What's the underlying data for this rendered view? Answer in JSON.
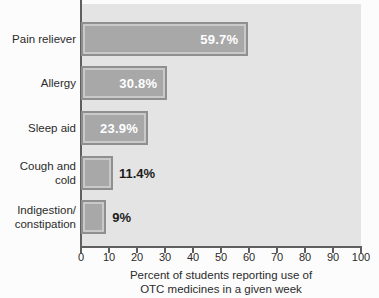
{
  "chart_data": {
    "type": "bar",
    "orientation": "horizontal",
    "categories": [
      "Pain reliever",
      "Allergy",
      "Sleep aid",
      "Cough and\ncold",
      "Indigestion/\nconstipation"
    ],
    "values": [
      59.7,
      30.8,
      23.9,
      11.4,
      9
    ],
    "value_labels": [
      "59.7%",
      "30.8%",
      "23.9%",
      "11.4%",
      "9%"
    ],
    "title": "",
    "xlabel": "Percent of students reporting use of\nOTC medicines in a given week",
    "ylabel": "",
    "xlim": [
      0,
      100
    ],
    "x_ticks": [
      0,
      10,
      20,
      30,
      40,
      50,
      60,
      70,
      80,
      90,
      100
    ],
    "grid": false,
    "colors": {
      "page_background": "#fcfcfc",
      "plot_background": "#e4e4e4",
      "bar_fill": "#a8a8a8",
      "bar_border": "#8f8f8f",
      "bar_inner_gap": "#c9c9c9",
      "axis": "#5f5f5f",
      "label_text": "#2b2b2b",
      "value_inside_text": "#ffffff",
      "value_outside_text": "#1c1c1c"
    }
  }
}
